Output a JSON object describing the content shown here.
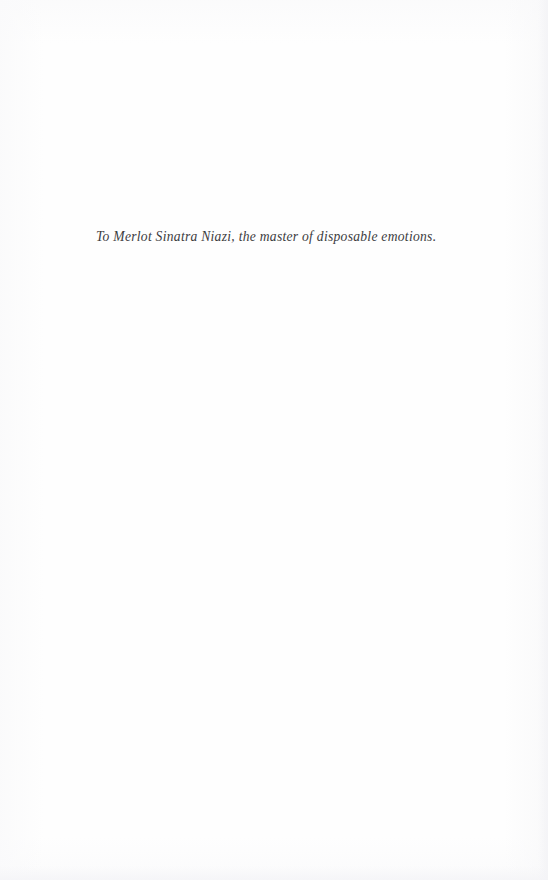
{
  "page": {
    "kind": "dedication-page",
    "background_color": "#fefefe",
    "width": 548,
    "height": 880
  },
  "dedication": {
    "text": "To Merlot Sinatra Niazi, the master of disposable emotions.",
    "style": "italic",
    "color": "#3c3c3e"
  },
  "header": {
    "text": ""
  },
  "footer": {
    "page_number": ""
  }
}
